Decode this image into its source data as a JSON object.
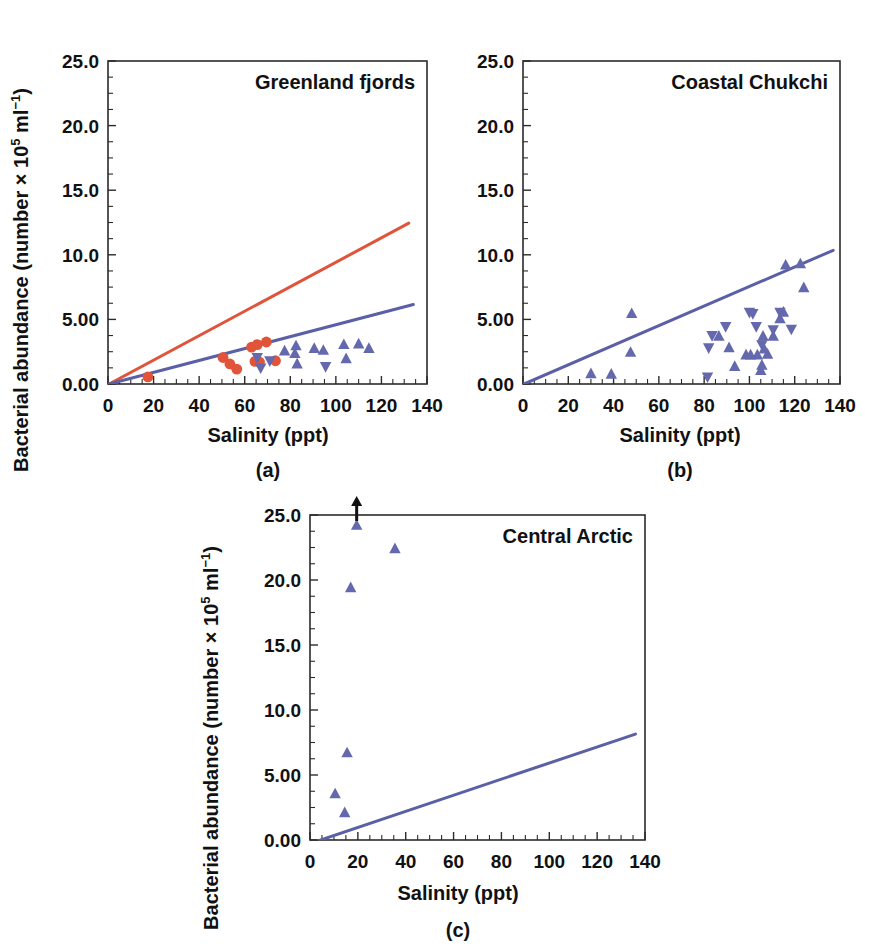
{
  "figure": {
    "axis_x_title": "Salinity (ppt)",
    "axis_y_title_main": "Bacterial abundance (number ",
    "axis_y_title_times": "× 10",
    "axis_y_sup_5": "5",
    "axis_y_mid": " ml",
    "axis_y_sup_neg1": "−1",
    "axis_y_close": ")",
    "colors": {
      "orange": "#e0543a",
      "blue": "#5b5fa6",
      "marker_blue": "#6468ad",
      "axis": "#2b2b28",
      "black": "#111111",
      "background": "#ffffff"
    }
  },
  "chart_data": [
    {
      "type": "scatter",
      "id": "panel-a",
      "title": "Greenland fjords",
      "caption": "(a)",
      "xlabel": "Salinity (ppt)",
      "ylabel": "Bacterial abundance (number × 10^5 ml^-1)",
      "xlim": [
        0,
        140
      ],
      "ylim": [
        0,
        25
      ],
      "xticks": [
        0,
        20,
        40,
        60,
        80,
        100,
        120,
        140
      ],
      "xticklabels": [
        "0",
        "20",
        "40",
        "60",
        "80",
        "100",
        "120",
        "140"
      ],
      "yticks": [
        0,
        5,
        10,
        15,
        20,
        25
      ],
      "yticklabels": [
        "0.00",
        "5.00",
        "10.0",
        "15.0",
        "20.0",
        "25.0"
      ],
      "grid": false,
      "legend": "none",
      "series": [
        {
          "name": "orange-circles",
          "marker": "circle",
          "color": "#e0543a",
          "points": [
            [
              17.5,
              0.55
            ],
            [
              50.5,
              2.05
            ],
            [
              53.5,
              1.55
            ],
            [
              56.5,
              1.15
            ],
            [
              63.0,
              2.85
            ],
            [
              64.5,
              1.75
            ],
            [
              65.5,
              3.05
            ],
            [
              66.5,
              1.7
            ],
            [
              69.5,
              3.25
            ],
            [
              73.5,
              1.8
            ]
          ]
        },
        {
          "name": "blue-up-triangles",
          "marker": "triangle-up",
          "color": "#6468ad",
          "points": [
            [
              77.5,
              2.55
            ],
            [
              82.0,
              2.35
            ],
            [
              82.5,
              2.95
            ],
            [
              83.0,
              1.55
            ],
            [
              90.5,
              2.75
            ],
            [
              94.5,
              2.6
            ],
            [
              103.5,
              3.05
            ],
            [
              104.5,
              1.95
            ],
            [
              110.0,
              3.1
            ],
            [
              114.5,
              2.75
            ]
          ]
        },
        {
          "name": "blue-down-triangles",
          "marker": "triangle-down",
          "color": "#6468ad",
          "points": [
            [
              65.5,
              2.05
            ],
            [
              67.0,
              1.25
            ],
            [
              71.0,
              1.8
            ],
            [
              95.5,
              1.35
            ]
          ]
        }
      ],
      "fit_lines": [
        {
          "name": "orange-regression",
          "color": "#e0543a",
          "x0": 0.5,
          "y0": 0.0,
          "x1": 132.0,
          "y1": 12.45
        },
        {
          "name": "blue-regression",
          "color": "#5b5fa6",
          "x0": 0.5,
          "y0": 0.0,
          "x1": 134.0,
          "y1": 6.15
        }
      ]
    },
    {
      "type": "scatter",
      "id": "panel-b",
      "title": "Coastal Chukchi",
      "caption": "(b)",
      "xlabel": "Salinity (ppt)",
      "ylabel": "",
      "xlim": [
        0,
        140
      ],
      "ylim": [
        0,
        25
      ],
      "xticks": [
        0,
        20,
        40,
        60,
        80,
        100,
        120,
        140
      ],
      "xticklabels": [
        "0",
        "20",
        "40",
        "60",
        "80",
        "100",
        "120",
        "140"
      ],
      "yticks": [
        0,
        5,
        10,
        15,
        20,
        25
      ],
      "yticklabels": [
        "0.00",
        "5.00",
        "10.0",
        "15.0",
        "20.0",
        "25.0"
      ],
      "grid": false,
      "legend": "none",
      "series": [
        {
          "name": "blue-up-triangles",
          "marker": "triangle-up",
          "color": "#6468ad",
          "points": [
            [
              30.0,
              0.8
            ],
            [
              39.0,
              0.75
            ],
            [
              47.5,
              2.45
            ],
            [
              48.0,
              5.45
            ],
            [
              86.5,
              3.7
            ],
            [
              91.0,
              2.8
            ],
            [
              93.5,
              1.35
            ],
            [
              98.5,
              2.25
            ],
            [
              100.5,
              2.25
            ],
            [
              103.5,
              2.25
            ],
            [
              105.0,
              1.05
            ],
            [
              105.5,
              1.45
            ],
            [
              106.0,
              3.7
            ],
            [
              106.5,
              2.7
            ],
            [
              108.0,
              2.3
            ],
            [
              110.5,
              3.7
            ],
            [
              113.5,
              5.05
            ],
            [
              115.0,
              5.55
            ],
            [
              116.0,
              9.2
            ],
            [
              122.5,
              9.3
            ],
            [
              124.0,
              7.45
            ]
          ]
        },
        {
          "name": "blue-down-triangles",
          "marker": "triangle-down",
          "color": "#6468ad",
          "points": [
            [
              81.5,
              0.55
            ],
            [
              82.0,
              2.8
            ],
            [
              83.5,
              3.75
            ],
            [
              89.5,
              4.45
            ],
            [
              100.0,
              5.55
            ],
            [
              101.5,
              5.45
            ],
            [
              103.0,
              4.45
            ],
            [
              105.5,
              3.05
            ],
            [
              110.5,
              4.2
            ],
            [
              113.5,
              5.55
            ],
            [
              118.5,
              4.25
            ]
          ]
        }
      ],
      "fit_lines": [
        {
          "name": "blue-regression",
          "color": "#5b5fa6",
          "x0": 0.5,
          "y0": 0.0,
          "x1": 137.0,
          "y1": 10.35
        }
      ]
    },
    {
      "type": "scatter",
      "id": "panel-c",
      "title": "Central Arctic",
      "caption": "(c)",
      "xlabel": "Salinity (ppt)",
      "ylabel": "Bacterial abundance (number × 10^5 ml^-1)",
      "xlim": [
        0,
        140
      ],
      "ylim": [
        0,
        25
      ],
      "xticks": [
        0,
        20,
        40,
        60,
        80,
        100,
        120,
        140
      ],
      "xticklabels": [
        "0",
        "20",
        "40",
        "60",
        "80",
        "100",
        "120",
        "140"
      ],
      "yticks": [
        0,
        5,
        10,
        15,
        20,
        25
      ],
      "yticklabels": [
        "0.00",
        "5.00",
        "10.0",
        "15.0",
        "20.0",
        "25.0"
      ],
      "grid": false,
      "legend": "none",
      "series": [
        {
          "name": "blue-up-triangles",
          "marker": "triangle-up",
          "color": "#6468ad",
          "points": [
            [
              10.5,
              3.55
            ],
            [
              14.5,
              2.1
            ],
            [
              15.5,
              6.7
            ],
            [
              17.0,
              19.4
            ],
            [
              19.5,
              24.2
            ],
            [
              35.5,
              22.4
            ]
          ]
        }
      ],
      "annotations": [
        {
          "name": "off-scale-arrow",
          "marker": "arrow-up",
          "color": "#111111",
          "x": 19.5,
          "y": 25.0,
          "note": "off-scale indicator at top axis"
        }
      ],
      "fit_lines": [
        {
          "name": "blue-regression",
          "color": "#5b5fa6",
          "x0": 2.0,
          "y0": -0.15,
          "x1": 136.0,
          "y1": 8.15
        }
      ]
    }
  ]
}
